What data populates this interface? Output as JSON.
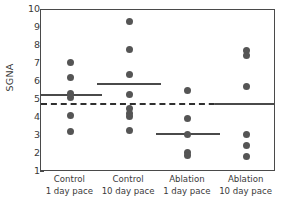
{
  "chart_data": {
    "type": "scatter",
    "title": "",
    "xlabel": "",
    "ylabel": "SGNA",
    "ylim": [
      1,
      10
    ],
    "yticks": [
      1,
      2,
      3,
      4,
      5,
      6,
      7,
      8,
      9,
      10
    ],
    "grid": false,
    "legend": "none",
    "categories": [
      "Control 1 day pace",
      "Control 10 day pace",
      "Ablation 1 day pace",
      "Ablation 10 day pace"
    ],
    "reference_line": {
      "label": "overall reference",
      "value": 4.75,
      "style": "dashed"
    },
    "groups": [
      {
        "name": "Control 1 day pace",
        "line1": "Control",
        "line2": "1 day pace",
        "values": [
          7.1,
          6.25,
          5.35,
          5.15,
          4.15,
          3.25
        ],
        "mean": 5.25
      },
      {
        "name": "Control 10 day pace",
        "line1": "Control",
        "line2": "10 day pace",
        "values": [
          9.35,
          7.8,
          6.4,
          5.3,
          4.55,
          4.25,
          4.1,
          3.3
        ],
        "mean": 5.85
      },
      {
        "name": "Ablation 1 day pace",
        "line1": "Ablation",
        "line2": "1 day pace",
        "values": [
          5.55,
          3.95,
          3.1,
          2.1,
          1.9
        ],
        "mean": 3.08
      },
      {
        "name": "Ablation 10 day pace",
        "line1": "Ablation",
        "line2": "10 day pace",
        "values": [
          7.75,
          7.5,
          5.75,
          3.1,
          2.5,
          1.85
        ],
        "mean": 4.78
      }
    ],
    "colors": {
      "dot": "#555555",
      "mean_line": "#4a4a4a",
      "reference_line": "#2f2f2f",
      "axis": "#4a4a4a",
      "background": "#ffffff"
    }
  }
}
